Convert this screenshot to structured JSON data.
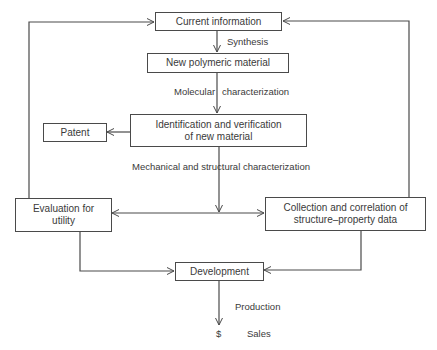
{
  "diagram": {
    "type": "flowchart",
    "nodes": {
      "current_information": "Current information",
      "new_polymeric_material": "New polymeric material",
      "identification": "Identification and verification of new material",
      "identification_line1": "Identification and verification",
      "identification_line2": "of new material",
      "patent": "Patent",
      "evaluation_line1": "Evaluation for",
      "evaluation_line2": "utility",
      "collection_line1": "Collection and correlation of",
      "collection_line2": "structure–property data",
      "development": "Development"
    },
    "edge_labels": {
      "synthesis": "Synthesis",
      "molecular": "Molecular",
      "characterization": "characterization",
      "mechanical": "Mechanical and structural characterization",
      "production": "Production",
      "dollar": "$",
      "sales": "Sales"
    },
    "edges": [
      {
        "from": "Current information",
        "to": "New polymeric material",
        "label": "Synthesis"
      },
      {
        "from": "New polymeric material",
        "to": "Identification and verification of new material",
        "label": "Molecular characterization"
      },
      {
        "from": "Identification and verification of new material",
        "to": "Patent"
      },
      {
        "from": "Identification and verification of new material",
        "to": "Evaluation for utility",
        "label": "Mechanical and structural characterization"
      },
      {
        "from": "Identification and verification of new material",
        "to": "Collection and correlation of structure–property data",
        "label": "Mechanical and structural characterization"
      },
      {
        "from": "Evaluation for utility",
        "to": "Current information"
      },
      {
        "from": "Collection and correlation of structure–property data",
        "to": "Current information"
      },
      {
        "from": "Evaluation for utility",
        "to": "Development"
      },
      {
        "from": "Collection and correlation of structure–property data",
        "to": "Development"
      },
      {
        "from": "Development",
        "to": "$ Sales",
        "label": "Production"
      }
    ],
    "colors": {
      "line": "#4a4a4a",
      "text": "#3a3a3a",
      "background": "#ffffff"
    }
  }
}
